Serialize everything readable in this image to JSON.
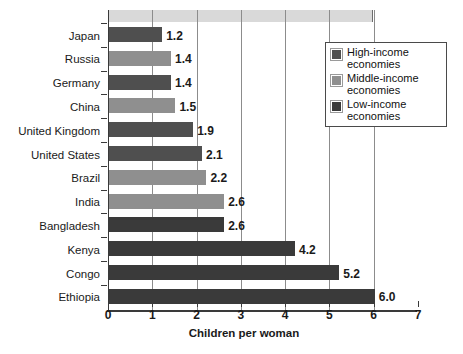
{
  "chart_data": {
    "type": "bar",
    "orientation": "horizontal",
    "title": "",
    "xlabel": "Children per woman",
    "ylabel": "",
    "xlim": [
      0,
      7
    ],
    "xticks": [
      "0",
      "1",
      "2",
      "3",
      "4",
      "5",
      "6",
      "7"
    ],
    "grid": true,
    "legend_position": "upper-right",
    "categories": [
      "Japan",
      "Russia",
      "Germany",
      "China",
      "United Kingdom",
      "United States",
      "Brazil",
      "India",
      "Bangladesh",
      "Kenya",
      "Congo",
      "Ethiopia"
    ],
    "values": [
      1.2,
      1.4,
      1.4,
      1.5,
      1.9,
      2.1,
      2.2,
      2.6,
      2.6,
      4.2,
      5.2,
      6.0
    ],
    "value_labels": [
      "1.2",
      "1.4",
      "1.4",
      "1.5",
      "1.9",
      "2.1",
      "2.2",
      "2.6",
      "2.6",
      "4.2",
      "5.2",
      "6.0"
    ],
    "groups": [
      "high",
      "middle",
      "high",
      "middle",
      "high",
      "high",
      "middle",
      "middle",
      "low",
      "low",
      "low",
      "low"
    ],
    "series": [
      {
        "name": "High-income economies",
        "key": "high",
        "color": "#4f4f4f",
        "points": [
          {
            "category": "Japan",
            "value": 1.2
          },
          {
            "category": "Germany",
            "value": 1.4
          },
          {
            "category": "United Kingdom",
            "value": 1.9
          },
          {
            "category": "United States",
            "value": 2.1
          }
        ]
      },
      {
        "name": "Middle-income economies",
        "key": "middle",
        "color": "#8f8f8f",
        "points": [
          {
            "category": "Russia",
            "value": 1.4
          },
          {
            "category": "China",
            "value": 1.5
          },
          {
            "category": "Brazil",
            "value": 2.2
          },
          {
            "category": "India",
            "value": 2.6
          }
        ]
      },
      {
        "name": "Low-income economies",
        "key": "low",
        "color": "#3a3a3a",
        "points": [
          {
            "category": "Bangladesh",
            "value": 2.6
          },
          {
            "category": "Kenya",
            "value": 4.2
          },
          {
            "category": "Congo",
            "value": 5.2
          },
          {
            "category": "Ethiopia",
            "value": 6.0
          }
        ]
      }
    ]
  },
  "legend": {
    "items": [
      {
        "label_line1": "High-income",
        "label_line2": "economies",
        "key": "high"
      },
      {
        "label_line1": "Middle-income",
        "label_line2": "economies",
        "key": "middle"
      },
      {
        "label_line1": "Low-income",
        "label_line2": "economies",
        "key": "low"
      }
    ]
  }
}
